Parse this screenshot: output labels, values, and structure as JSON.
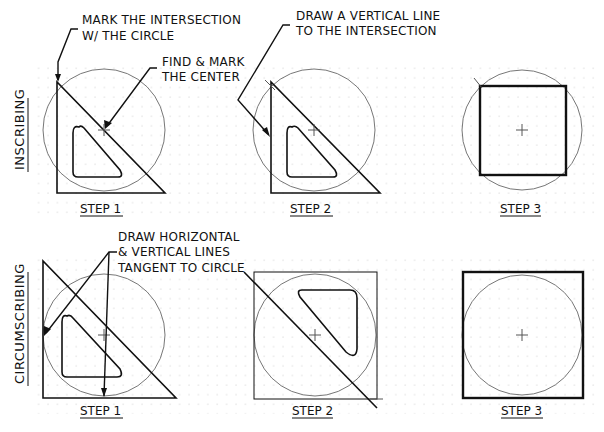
{
  "rows": [
    {
      "label": "INSCRIBING",
      "steps": [
        {
          "label": "STEP 1"
        },
        {
          "label": "STEP 2"
        },
        {
          "label": "STEP 3"
        }
      ]
    },
    {
      "label": "CIRCUMSCRIBING",
      "steps": [
        {
          "label": "STEP 1"
        },
        {
          "label": "STEP 2"
        },
        {
          "label": "STEP 3"
        }
      ]
    }
  ],
  "annotations": {
    "mark_intersection": [
      "MARK THE INTERSECTION",
      "W/ THE CIRCLE"
    ],
    "find_center": [
      "FIND & MARK",
      "THE CENTER"
    ],
    "draw_vertical": [
      "DRAW A VERTICAL LINE",
      "TO THE INTERSECTION"
    ],
    "draw_tangent": [
      "DRAW HORIZONTAL",
      "& VERTICAL LINES",
      "TANGENT TO CIRCLE"
    ]
  },
  "colors": {
    "line": "#111111",
    "circle": "#777777",
    "grid": "#b5b5b5"
  }
}
